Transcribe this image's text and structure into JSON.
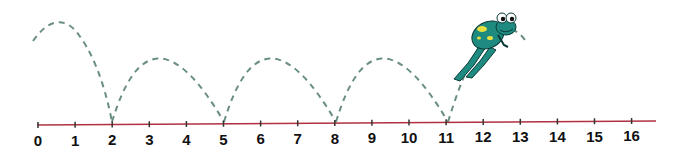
{
  "number_line": {
    "min": 0,
    "max": 16,
    "labels": [
      "0",
      "1",
      "2",
      "3",
      "4",
      "5",
      "6",
      "7",
      "8",
      "9",
      "10",
      "11",
      "12",
      "13",
      "14",
      "15",
      "16"
    ],
    "line_color": "#b03040"
  },
  "jumps": {
    "description": "Frog jumps of 3 along the number line",
    "landing_points": [
      2,
      5,
      8,
      11
    ],
    "jump_size": 3,
    "arc_color": "#6a8f80"
  },
  "frog": {
    "icon": "frog-icon",
    "body_color": "#1e8a80",
    "spot_color": "#e8e040"
  }
}
